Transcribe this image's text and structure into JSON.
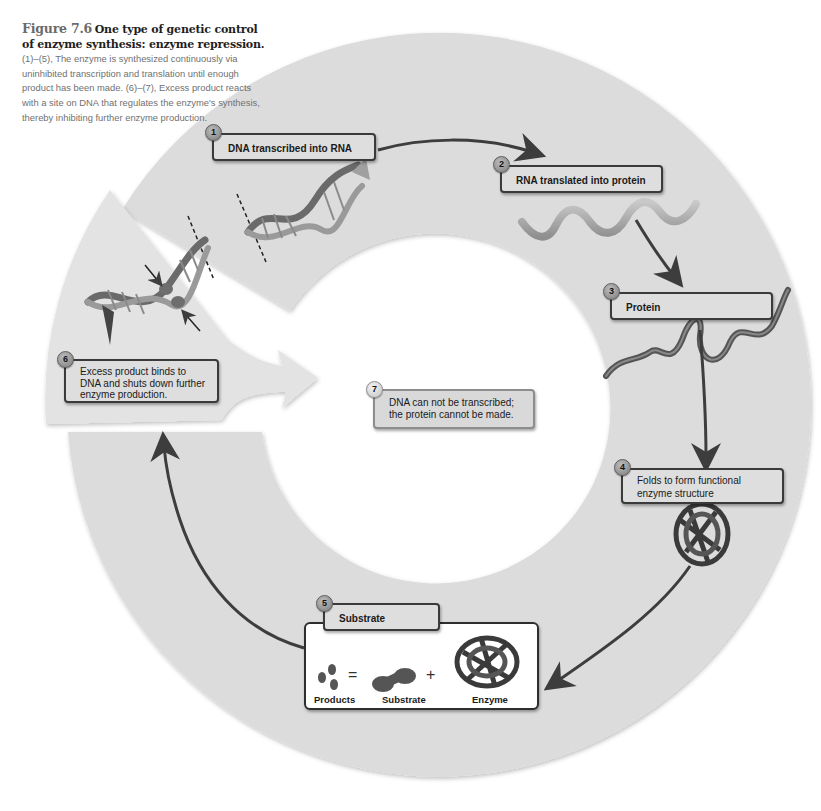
{
  "caption": {
    "figure_number": "Figure 7.6",
    "title": "One type of genetic control of enzyme synthesis: enzyme repression.",
    "body": "(1)–(5), The enzyme is synthesized continuously via uninhibited transcription and translation until enough product has been made. (6)–(7), Excess product reacts with a site on DNA that regulates the enzyme's synthesis, thereby inhibiting further enzyme production."
  },
  "steps": [
    {
      "number": "1",
      "label": "DNA transcribed into RNA"
    },
    {
      "number": "2",
      "label": "RNA translated into protein"
    },
    {
      "number": "3",
      "label": "Protein"
    },
    {
      "number": "4",
      "label": "Folds to form functional enzyme structure"
    },
    {
      "number": "5",
      "label": "Substrate"
    },
    {
      "number": "6",
      "label": "Excess product binds to DNA and shuts down further enzyme production."
    },
    {
      "number": "7",
      "label": "DNA can not be transcribed; the protein cannot be made."
    }
  ],
  "reaction": {
    "products_label": "Products",
    "substrate_label": "Substrate",
    "enzyme_label": "Enzyme",
    "equals_symbol": "=",
    "plus_symbol": "+"
  },
  "colors": {
    "ring": "#dcdcdc",
    "detached_wedge": "#e4e4e4",
    "arrow": "#3d3d3d",
    "box_fill": "#dedede",
    "box_border": "#3a3a3a",
    "rna": "#a8a8a8",
    "protein": "#5a5a5a"
  }
}
